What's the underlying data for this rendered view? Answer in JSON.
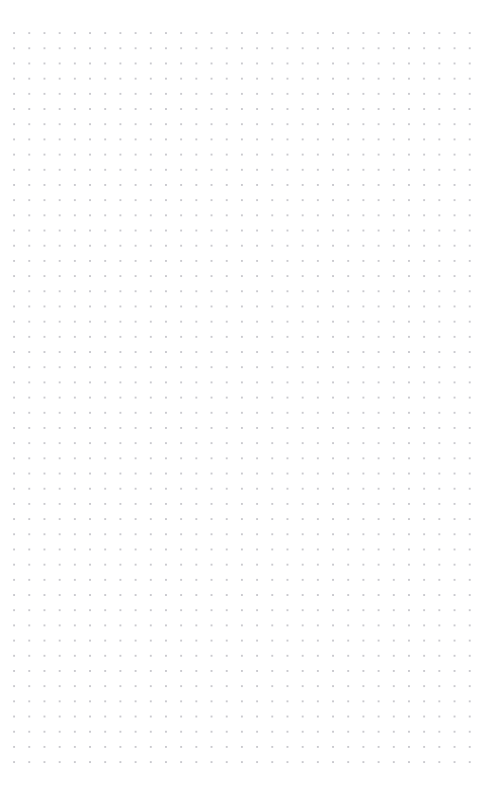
{
  "page": {
    "width": 501,
    "height": 794,
    "background_color": "#ffffff",
    "content_text": "",
    "notes": ""
  },
  "grid": {
    "name": "dot-grid",
    "dot_color": "#c9c9ce",
    "dot_radius_px": 0.85,
    "pitch_x_px": 15.2,
    "pitch_y_px": 15.2,
    "origin_x_px": 14,
    "origin_y_px": 33,
    "columns": 31,
    "rows": 49,
    "margin_top_px": 33,
    "margin_bottom_px": 26,
    "margin_left_px": 14,
    "margin_right_px": 31
  }
}
